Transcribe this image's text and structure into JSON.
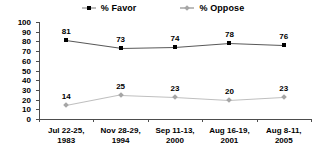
{
  "chart_data": {
    "type": "line",
    "title": "",
    "xlabel": "",
    "ylabel": "",
    "ylim": [
      0,
      100
    ],
    "yticks": [
      0,
      10,
      20,
      30,
      40,
      50,
      60,
      70,
      80,
      90,
      100
    ],
    "grid": false,
    "legend_position": "top-center",
    "categories": [
      "Jul 22-25,\n1983",
      "Nov 28-29,\n1994",
      "Sep 11-13,\n2000",
      "Aug 16-19,\n2001",
      "Aug 8-11,\n2005"
    ],
    "category_lines": [
      [
        "Jul 22-25,",
        "1983"
      ],
      [
        "Nov 28-29,",
        "1994"
      ],
      [
        "Sep 11-13,",
        "2000"
      ],
      [
        "Aug 16-19,",
        "2001"
      ],
      [
        "Aug 8-11,",
        "2005"
      ]
    ],
    "series": [
      {
        "name": "% Favor",
        "marker": "square",
        "color": "#000000",
        "line_color": "#595959",
        "values": [
          81,
          73,
          74,
          78,
          76
        ]
      },
      {
        "name": "% Oppose",
        "marker": "diamond",
        "color": "#a6a6a6",
        "line_color": "#bfbfbf",
        "values": [
          14,
          25,
          23,
          20,
          23
        ]
      }
    ]
  },
  "legend": {
    "entries": [
      {
        "label": "% Favor"
      },
      {
        "label": "% Oppose"
      }
    ]
  }
}
